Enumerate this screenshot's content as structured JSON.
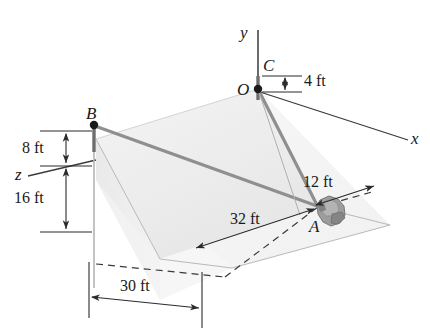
{
  "figure": {
    "background_color": "#ffffff",
    "line_color": "#3a3a3a",
    "cable_color": "#8a8a8a",
    "plane_top_fill": "#ececec",
    "plane_incline_fill": "#f2f2f2",
    "plane_side_fill": "#e2e2e2",
    "ground_fill": "#f7f7f7",
    "rock_color": "#9a9a9a"
  },
  "axes": [
    {
      "id": "y-axis",
      "label": "y"
    },
    {
      "id": "x-axis",
      "label": "x"
    },
    {
      "id": "z-axis",
      "label": "z"
    }
  ],
  "points": [
    {
      "id": "point-O",
      "label": "O"
    },
    {
      "id": "point-C",
      "label": "C"
    },
    {
      "id": "point-B",
      "label": "B"
    },
    {
      "id": "point-A",
      "label": "A"
    }
  ],
  "dimensions": [
    {
      "id": "dim-4ft",
      "label": "4 ft",
      "value": 4,
      "unit": "ft",
      "describes": "height of C above O along y"
    },
    {
      "id": "dim-8ft",
      "label": "8 ft",
      "value": 8,
      "unit": "ft",
      "describes": "height of B above the inclined plane top edge"
    },
    {
      "id": "dim-16ft",
      "label": "16 ft",
      "value": 16,
      "unit": "ft",
      "describes": "height from z-axis level down to the ground plane at B"
    },
    {
      "id": "dim-12ft",
      "label": "12 ft",
      "value": 12,
      "unit": "ft",
      "describes": "offset from A along the dashed ground line toward +x"
    },
    {
      "id": "dim-32ft",
      "label": "32 ft",
      "value": 32,
      "unit": "ft",
      "describes": "distance along the dashed ground line to A"
    },
    {
      "id": "dim-30ft",
      "label": "30 ft",
      "value": 30,
      "unit": "ft",
      "describes": "base width of the inclined plane along the front edge"
    }
  ],
  "members": [
    {
      "id": "cable-OA",
      "from": "O",
      "to": "A",
      "type": "cable"
    },
    {
      "id": "cable-BA",
      "from": "B",
      "to": "A",
      "type": "cable"
    },
    {
      "id": "pole-B",
      "from": "B",
      "to": "ground",
      "type": "pole"
    },
    {
      "id": "pole-OC",
      "from": "O",
      "to": "C",
      "type": "pole"
    }
  ],
  "objects": [
    {
      "id": "rock-at-A",
      "label": "",
      "description": "irregular gray block resting at point A"
    }
  ]
}
